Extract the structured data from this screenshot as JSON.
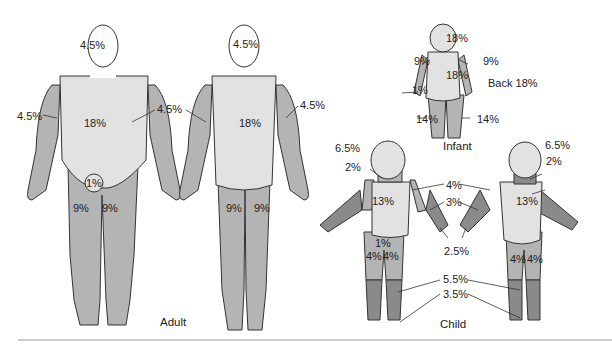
{
  "colors": {
    "light": "#e2e2e2",
    "mid": "#b4b4b4",
    "dark": "#8a8a8a",
    "outline": "#333333"
  },
  "adult": {
    "caption": "Adult",
    "front": {
      "head": "4.5%",
      "arm_left": "4.5%",
      "arm_right": "4.5%",
      "trunk": "18%",
      "genitals": "1%",
      "leg_left": "9%",
      "leg_right": "9%"
    },
    "back": {
      "head": "4.5%",
      "arm_right": "4.5%",
      "trunk": "18%",
      "leg_left": "9%",
      "leg_right": "9%"
    }
  },
  "infant": {
    "caption": "Infant",
    "head": "18%",
    "arm_left": "9%",
    "arm_right": "9%",
    "trunk": "18%",
    "genitals": "1%",
    "leg_left": "14%",
    "leg_right": "14%",
    "back_note": "Back 18%"
  },
  "child": {
    "caption": "Child",
    "head": "6.5%",
    "neck": "2%",
    "trunk": "13%",
    "genitals": "1%",
    "thigh_left": "4%",
    "thigh_right": "4%",
    "upper_arm": "4%",
    "forearm": "3%",
    "hand": "2.5%",
    "lower_leg": "5.5%",
    "foot": "3.5%",
    "back": {
      "head": "6.5%",
      "neck": "2%",
      "trunk": "13%",
      "thigh_left": "4%",
      "thigh_right": "4%"
    }
  }
}
